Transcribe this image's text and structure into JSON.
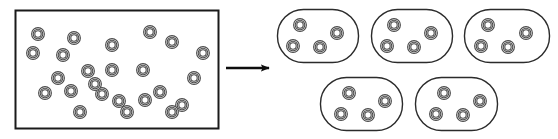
{
  "canvas": {
    "width": 558,
    "height": 139,
    "background": "#ffffff"
  },
  "style": {
    "container_stroke": "#1a1a1a",
    "container_fill": "#ffffff",
    "container_stroke_width": 2,
    "capsule_stroke": "#2b2b2b",
    "capsule_stroke_width": 1.4,
    "capsule_corner_radius": 26,
    "particle_outer_stroke": "#4a4a4a",
    "particle_inner_stroke": "#4a4a4a",
    "particle_fill": "#ffffff",
    "arrow_color": "#0d0d0d",
    "arrow_stroke_width": 2.4
  },
  "diagram": {
    "source_container": {
      "label": "bulk-container",
      "shape": "rectangle",
      "x": 15,
      "y": 10,
      "width": 203,
      "height": 118,
      "particle_count": 24,
      "particles": [
        {
          "cx": 38,
          "cy": 34
        },
        {
          "cx": 74,
          "cy": 38
        },
        {
          "cx": 112,
          "cy": 45
        },
        {
          "cx": 150,
          "cy": 32
        },
        {
          "cx": 172,
          "cy": 42
        },
        {
          "cx": 33,
          "cy": 53
        },
        {
          "cx": 63,
          "cy": 55
        },
        {
          "cx": 203,
          "cy": 53
        },
        {
          "cx": 88,
          "cy": 71
        },
        {
          "cx": 112,
          "cy": 70
        },
        {
          "cx": 143,
          "cy": 70
        },
        {
          "cx": 194,
          "cy": 78
        },
        {
          "cx": 45,
          "cy": 93
        },
        {
          "cx": 71,
          "cy": 91
        },
        {
          "cx": 102,
          "cy": 94
        },
        {
          "cx": 119,
          "cy": 101
        },
        {
          "cx": 145,
          "cy": 100
        },
        {
          "cx": 160,
          "cy": 92
        },
        {
          "cx": 80,
          "cy": 112
        },
        {
          "cx": 127,
          "cy": 112
        },
        {
          "cx": 182,
          "cy": 105
        },
        {
          "cx": 95,
          "cy": 84
        },
        {
          "cx": 58,
          "cy": 78
        },
        {
          "cx": 172,
          "cy": 112
        }
      ]
    },
    "arrow": {
      "label": "transformation-arrow",
      "x1": 226,
      "y1": 68,
      "x2": 270,
      "y2": 68,
      "head_length": 9,
      "head_width": 9
    },
    "groups": [
      {
        "label": "group-1",
        "x": 277,
        "y": 9,
        "width": 81,
        "height": 53,
        "particle_count": 4,
        "particles": [
          {
            "cx": 300,
            "cy": 25
          },
          {
            "cx": 337,
            "cy": 33
          },
          {
            "cx": 293,
            "cy": 46
          },
          {
            "cx": 320,
            "cy": 47
          }
        ]
      },
      {
        "label": "group-2",
        "x": 371,
        "y": 9,
        "width": 81,
        "height": 53,
        "particle_count": 4,
        "particles": [
          {
            "cx": 394,
            "cy": 25
          },
          {
            "cx": 431,
            "cy": 33
          },
          {
            "cx": 387,
            "cy": 46
          },
          {
            "cx": 414,
            "cy": 47
          }
        ]
      },
      {
        "label": "group-3",
        "x": 464,
        "y": 9,
        "width": 85,
        "height": 53,
        "particle_count": 4,
        "particles": [
          {
            "cx": 488,
            "cy": 25
          },
          {
            "cx": 526,
            "cy": 33
          },
          {
            "cx": 481,
            "cy": 46
          },
          {
            "cx": 508,
            "cy": 47
          }
        ]
      },
      {
        "label": "group-4",
        "x": 320,
        "y": 77,
        "width": 82,
        "height": 53,
        "particle_count": 4,
        "particles": [
          {
            "cx": 349,
            "cy": 93
          },
          {
            "cx": 385,
            "cy": 101
          },
          {
            "cx": 341,
            "cy": 114
          },
          {
            "cx": 368,
            "cy": 115
          }
        ]
      },
      {
        "label": "group-5",
        "x": 415,
        "y": 77,
        "width": 82,
        "height": 53,
        "particle_count": 4,
        "particles": [
          {
            "cx": 444,
            "cy": 93
          },
          {
            "cx": 480,
            "cy": 101
          },
          {
            "cx": 436,
            "cy": 114
          },
          {
            "cx": 463,
            "cy": 115
          }
        ]
      }
    ],
    "particle_geometry": {
      "outer_radius": 6.4,
      "mid_radius": 4.8,
      "inner_radius": 3.2,
      "ring_stroke_width": 1.1
    }
  }
}
